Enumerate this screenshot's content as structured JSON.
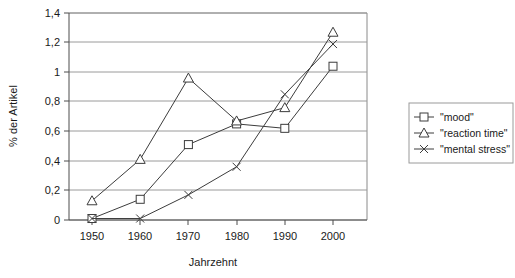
{
  "chart_data": {
    "type": "line",
    "title": "",
    "xlabel": "Jahrzehnt",
    "ylabel": "% der Artikel",
    "categories": [
      "1950",
      "1960",
      "1970",
      "1980",
      "1990",
      "2000"
    ],
    "x": [
      1950,
      1960,
      1970,
      1980,
      1990,
      2000
    ],
    "xlim": [
      1950,
      2000
    ],
    "ylim": [
      0,
      1.4
    ],
    "ytick_labels": [
      "0",
      "0,2",
      "0,4",
      "0,6",
      "0,8",
      "1",
      "1,2",
      "1,4"
    ],
    "ytick_values": [
      0,
      0.2,
      0.4,
      0.6,
      0.8,
      1.0,
      1.2,
      1.4
    ],
    "grid": "horizontal",
    "legend_position": "right",
    "series": [
      {
        "name": "\"mood\"",
        "marker": "square",
        "values": [
          0.01,
          0.14,
          0.51,
          0.65,
          0.62,
          1.04
        ]
      },
      {
        "name": "\"reaction time\"",
        "marker": "triangle",
        "values": [
          0.13,
          0.41,
          0.96,
          0.67,
          0.76,
          1.27
        ]
      },
      {
        "name": "\"mental stress\"",
        "marker": "cross",
        "values": [
          0.01,
          0.01,
          0.17,
          0.36,
          0.85,
          1.19
        ]
      }
    ]
  },
  "legend": {
    "items": [
      {
        "label": "\"mood\"",
        "marker": "square-marker-icon"
      },
      {
        "label": "\"reaction time\"",
        "marker": "triangle-marker-icon"
      },
      {
        "label": "\"mental stress\"",
        "marker": "cross-marker-icon"
      }
    ]
  },
  "axes": {
    "y_title": "% der Artikel",
    "x_title": "Jahrzehnt",
    "y_ticks": [
      "1,4",
      "1,2",
      "1",
      "0,8",
      "0,6",
      "0,4",
      "0,2",
      "0"
    ],
    "x_ticks": [
      "1950",
      "1960",
      "1970",
      "1980",
      "1990",
      "2000"
    ]
  },
  "colors": {
    "series_stroke": "#3c3c3c",
    "gridline": "#9a9a9a",
    "axis": "#4d4d4d",
    "background": "#ffffff"
  }
}
